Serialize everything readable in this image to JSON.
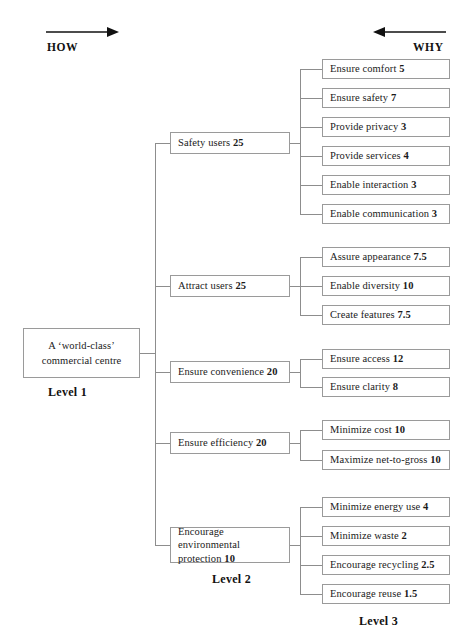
{
  "diagram": {
    "direction_labels": {
      "left": "HOW",
      "right": "WHY"
    },
    "level_labels": {
      "level1": "Level 1",
      "level2": "Level 2",
      "level3": "Level 3"
    },
    "root": {
      "line1": "A ‘world-class’",
      "line2": "commercial centre"
    },
    "branches": [
      {
        "label": "Safety users",
        "weight": "25",
        "children": [
          {
            "label": "Ensure comfort",
            "weight": "5"
          },
          {
            "label": "Ensure safety",
            "weight": "7"
          },
          {
            "label": "Provide privacy",
            "weight": "3"
          },
          {
            "label": "Provide services",
            "weight": "4"
          },
          {
            "label": "Enable interaction",
            "weight": "3"
          },
          {
            "label": "Enable communication",
            "weight": "3"
          }
        ]
      },
      {
        "label": "Attract users",
        "weight": "25",
        "children": [
          {
            "label": "Assure appearance",
            "weight": "7.5"
          },
          {
            "label": "Enable diversity",
            "weight": "10"
          },
          {
            "label": "Create features",
            "weight": "7.5"
          }
        ]
      },
      {
        "label": "Ensure convenience",
        "weight": "20",
        "children": [
          {
            "label": "Ensure access",
            "weight": "12"
          },
          {
            "label": "Ensure clarity",
            "weight": "8"
          }
        ]
      },
      {
        "label": "Ensure efficiency",
        "weight": "20",
        "children": [
          {
            "label": "Minimize cost",
            "weight": "10"
          },
          {
            "label": "Maximize net-to-gross",
            "weight": "10"
          }
        ]
      },
      {
        "label": "Encourage environmental protection",
        "weight": "10",
        "children": [
          {
            "label": "Minimize energy use",
            "weight": "4"
          },
          {
            "label": "Minimize waste",
            "weight": "2"
          },
          {
            "label": "Encourage recycling",
            "weight": "2.5"
          },
          {
            "label": "Encourage reuse",
            "weight": "1.5"
          }
        ]
      }
    ]
  }
}
